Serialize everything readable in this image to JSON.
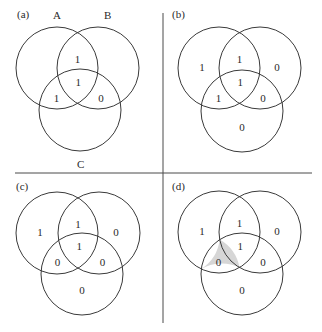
{
  "figure": {
    "width": 322,
    "height": 332,
    "colors": {
      "background": "#ffffff",
      "stroke": "#3a3a3a",
      "shade": "#d6d6d6",
      "text": "#2a2a2a"
    },
    "dividers": {
      "vertical": {
        "x": 163,
        "y1": 13,
        "y2": 323
      },
      "horizontal": {
        "y": 173,
        "x1": 15,
        "x2": 312
      }
    },
    "set_labels": {
      "A": "A",
      "B": "B",
      "C": "C"
    },
    "panels": [
      {
        "id": "a",
        "label": "(a)",
        "label_pos": [
          17,
          18
        ],
        "show_set_labels": true,
        "set_label_pos": {
          "A": [
            53,
            19
          ],
          "B": [
            104,
            19
          ],
          "C": [
            77,
            168
          ]
        },
        "circles": {
          "A": [
            57,
            68
          ],
          "B": [
            98,
            68
          ],
          "C": [
            80,
            110
          ]
        },
        "radius": 41,
        "regions": {
          "A_only": "",
          "B_only": "",
          "C_only": "",
          "AB": "1",
          "AC": "1",
          "BC": "0",
          "ABC": "1"
        },
        "shaded": []
      },
      {
        "id": "b",
        "label": "(b)",
        "label_pos": [
          172,
          18
        ],
        "show_set_labels": false,
        "circles": {
          "A": [
            219,
            68
          ],
          "B": [
            260,
            68
          ],
          "C": [
            242,
            111
          ]
        },
        "radius": 41,
        "regions": {
          "A_only": "1",
          "B_only": "0",
          "C_only": "0",
          "AB": "1",
          "AC": "1",
          "BC": "0",
          "ABC": "1"
        },
        "shaded": []
      },
      {
        "id": "c",
        "label": "(c)",
        "label_pos": [
          16,
          190
        ],
        "show_set_labels": false,
        "circles": {
          "A": [
            57,
            233
          ],
          "B": [
            99,
            233
          ],
          "C": [
            82,
            274
          ]
        },
        "radius": 41,
        "regions": {
          "A_only": "1",
          "B_only": "0",
          "C_only": "0",
          "AB": "1",
          "AC": "0",
          "BC": "0",
          "ABC": "1"
        },
        "shaded": []
      },
      {
        "id": "d",
        "label": "(d)",
        "label_pos": [
          172,
          190
        ],
        "show_set_labels": false,
        "circles": {
          "A": [
            219,
            232
          ],
          "B": [
            260,
            232
          ],
          "C": [
            242,
            274
          ]
        },
        "radius": 41,
        "regions": {
          "A_only": "1",
          "B_only": "0",
          "C_only": "0",
          "AB": "1",
          "AC": "0",
          "BC": "0",
          "ABC": "1"
        },
        "shaded": [
          "AC"
        ]
      }
    ]
  }
}
